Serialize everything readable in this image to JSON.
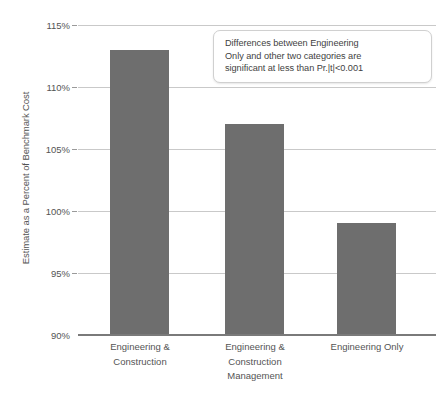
{
  "chart_data": {
    "type": "bar",
    "title": "",
    "subtitle": "",
    "xlabel": "",
    "ylabel": "Estimate as a Percent of Benchmark Cost",
    "categories": [
      "Engineering &\nConstruction",
      "Engineering &\nConstruction\nManagement",
      "Engineering Only"
    ],
    "values": [
      113,
      107,
      99
    ],
    "value_labels": [
      "113%",
      "107%",
      "99%"
    ],
    "ylim": [
      90,
      115
    ],
    "yticks": [
      115,
      110,
      105,
      100,
      95,
      90
    ],
    "ytick_labels": [
      "115%",
      "110%",
      "105%",
      "100%",
      "95%",
      "90%"
    ],
    "grid": true,
    "legend": false,
    "legend_position": "none",
    "bar_color": "#6e6e6e",
    "gridline_color": "#c9c9c9",
    "axis_color": "#7a7a7a",
    "text_color": "#545454",
    "annotations": [
      {
        "name": "significance-note",
        "text": "Differences between Engineering\nOnly and other two categories are\nsignificant at less than Pr.|t|<0.001"
      }
    ]
  }
}
